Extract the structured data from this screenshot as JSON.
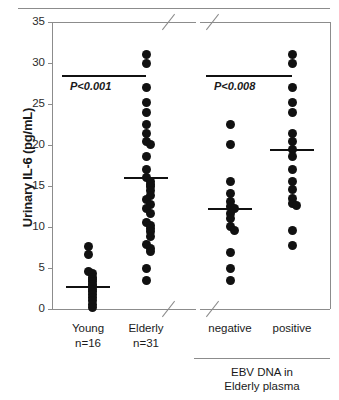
{
  "figure": {
    "ylabel": "Urinary IL-6 (pg/mL)",
    "caption_line1": "EBV DNA in",
    "caption_line2": "Elderly plasma",
    "axis_color": "#8c8c8c",
    "dot_color": "#111111"
  },
  "chart_data": {
    "type": "scatter",
    "title": "",
    "xlabel": "",
    "ylabel": "Urinary IL-6 (pg/mL)",
    "ylim": [
      0,
      35
    ],
    "yticks": [
      0,
      5,
      10,
      15,
      20,
      25,
      30,
      35
    ],
    "ytick_labels": [
      "0",
      "5",
      "10",
      "15",
      "20",
      "25",
      "30",
      "35"
    ],
    "grid": false,
    "legend": "none",
    "panels": [
      {
        "name": "panel-age",
        "annotation": "P<0.001",
        "groups": [
          {
            "label": "Young",
            "n_label": "n=16",
            "n": 16,
            "median": 2.7,
            "values": [
              7.6,
              6.6,
              4.6,
              4.3,
              3.9,
              3.6,
              3.3,
              3.0,
              2.7,
              2.4,
              2.1,
              1.8,
              1.4,
              1.0,
              0.5,
              0.2
            ]
          },
          {
            "label": "Elderly",
            "n_label": "n=31",
            "n": 31,
            "median": 16.0,
            "values": [
              31.0,
              30.0,
              27.0,
              25.2,
              24.0,
              22.5,
              21.4,
              20.4,
              20.1,
              18.6,
              17.0,
              16.0,
              15.6,
              14.9,
              14.4,
              13.9,
              13.3,
              12.8,
              11.7,
              10.6,
              10.2,
              9.8,
              9.4,
              8.9,
              7.9,
              7.4,
              7.0,
              4.9,
              3.5,
              15.2,
              12.2
            ]
          }
        ]
      },
      {
        "name": "panel-ebv",
        "annotation": "P<0.008",
        "groups": [
          {
            "label": "negative",
            "n_label": "",
            "n": 14,
            "median": 12.2,
            "values": [
              22.5,
              20.1,
              15.6,
              14.1,
              13.1,
              12.5,
              12.2,
              11.6,
              11.0,
              10.1,
              9.6,
              6.9,
              4.9,
              3.5
            ]
          },
          {
            "label": "positive",
            "n_label": "",
            "n": 17,
            "median": 19.4,
            "values": [
              31.0,
              30.0,
              27.0,
              25.2,
              24.0,
              21.4,
              20.4,
              19.4,
              18.6,
              17.0,
              15.6,
              14.6,
              13.5,
              12.9,
              12.6,
              9.6,
              7.7
            ]
          }
        ]
      }
    ]
  }
}
